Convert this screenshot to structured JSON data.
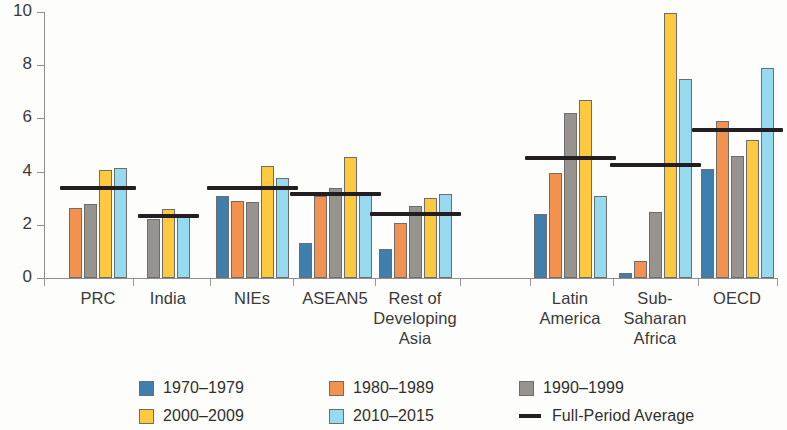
{
  "chart_data": {
    "type": "bar",
    "title": "",
    "subtitle": "",
    "xlabel": "",
    "ylabel": "",
    "ylim": [
      0,
      10
    ],
    "yticks": [
      0,
      2,
      4,
      6,
      8,
      10
    ],
    "grid": false,
    "legend_position": "bottom",
    "categories": [
      "PRC",
      "India",
      "NIEs",
      "ASEAN5",
      "Rest of Developing Asia",
      "Latin America",
      "Sub-Saharan Africa",
      "OECD"
    ],
    "category_label_lines": [
      [
        "PRC"
      ],
      [
        "India"
      ],
      [
        "NIEs"
      ],
      [
        "ASEAN5"
      ],
      [
        "Rest of",
        "Developing",
        "Asia"
      ],
      [
        "Latin",
        "America"
      ],
      [
        "Sub-",
        "Saharan",
        "Africa"
      ],
      [
        "OECD"
      ]
    ],
    "series": [
      {
        "name": "1970–1979",
        "color": "#3f7fae",
        "values": [
          null,
          null,
          3.1,
          1.3,
          1.1,
          2.4,
          0.2,
          4.1
        ]
      },
      {
        "name": "1980–1989",
        "color": "#f2924e",
        "values": [
          2.65,
          null,
          2.9,
          3.1,
          2.05,
          3.95,
          0.65,
          5.9
        ]
      },
      {
        "name": "1990–1999",
        "color": "#979490",
        "values": [
          2.8,
          2.2,
          2.85,
          3.4,
          2.7,
          6.2,
          2.5,
          4.6
        ]
      },
      {
        "name": "2000–2009",
        "color": "#fcc93f",
        "values": [
          4.05,
          2.6,
          4.2,
          4.55,
          3.0,
          6.7,
          9.95,
          5.2
        ]
      },
      {
        "name": "2010–2015",
        "color": "#96daf0",
        "values": [
          4.15,
          2.3,
          3.75,
          3.25,
          3.15,
          3.1,
          7.5,
          7.9
        ]
      }
    ],
    "full_period_average": {
      "name": "Full-Period Average",
      "color": "#231f20",
      "values": [
        3.4,
        2.35,
        3.4,
        3.15,
        2.4,
        4.5,
        4.25,
        5.55
      ]
    }
  },
  "legend": {
    "entries": [
      {
        "label": "1970–1979",
        "color": "#3f7fae",
        "marker": "square"
      },
      {
        "label": "1980–1989",
        "color": "#f2924e",
        "marker": "square"
      },
      {
        "label": "1990–1999",
        "color": "#979490",
        "marker": "square"
      },
      {
        "label": "2000–2009",
        "color": "#fcc93f",
        "marker": "square"
      },
      {
        "label": "2010–2015",
        "color": "#96daf0",
        "marker": "square"
      },
      {
        "label": "Full-Period Average",
        "color": "#231f20",
        "marker": "line"
      }
    ]
  },
  "axis": {
    "y_tick_labels": [
      "0",
      "2",
      "4",
      "6",
      "8",
      "10"
    ]
  }
}
